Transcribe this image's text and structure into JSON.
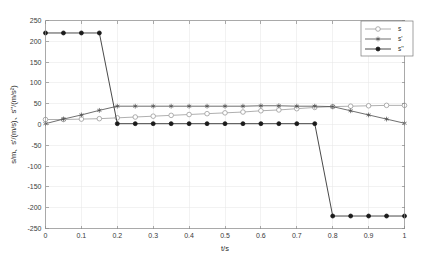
{
  "figure": {
    "background_color": "#ffffff",
    "axes_color": "#8a8a8a",
    "grid_color": "#e6e6e6"
  },
  "chart_data": {
    "type": "line",
    "title": "",
    "xlabel": "t/s",
    "ylabel": "s/m、s'/(m/s)、s''/(m/s²)",
    "xlim": [
      0,
      1
    ],
    "ylim": [
      -250,
      250
    ],
    "xticks": [
      0,
      0.1,
      0.2,
      0.3,
      0.4,
      0.5,
      0.6,
      0.7,
      0.8,
      0.9,
      1
    ],
    "xticklabels": [
      "0",
      "0.1",
      "0.2",
      "0.3",
      "0.4",
      "0.5",
      "0.6",
      "0.7",
      "0.8",
      "0.9",
      "1"
    ],
    "yticks": [
      -250,
      -200,
      -150,
      -100,
      -50,
      0,
      50,
      100,
      150,
      200,
      250
    ],
    "yticklabels": [
      "-250",
      "-200",
      "-150",
      "-100",
      "-50",
      "0",
      "50",
      "100",
      "150",
      "200",
      "250"
    ],
    "grid": true,
    "legend_position": "top-right",
    "x": [
      0,
      0.05,
      0.1,
      0.15,
      0.2,
      0.25,
      0.3,
      0.35,
      0.4,
      0.45,
      0.5,
      0.55,
      0.6,
      0.65,
      0.7,
      0.75,
      0.8,
      0.85,
      0.9,
      0.95,
      1
    ],
    "series": [
      {
        "name": "s",
        "marker": "circle-open",
        "color": "#9a9a9a",
        "values": [
          12,
          12,
          13,
          14,
          16,
          18,
          20,
          22,
          24,
          26,
          28,
          30,
          33,
          35,
          38,
          41,
          43,
          44,
          45,
          46,
          46
        ]
      },
      {
        "name": "s'",
        "marker": "asterisk",
        "color": "#4a4a4a",
        "values": [
          2,
          13,
          23,
          34,
          44,
          44,
          44,
          44,
          44,
          44,
          44,
          44,
          45,
          45,
          44,
          44,
          43,
          33,
          23,
          13,
          3
        ]
      },
      {
        "name": "s''",
        "marker": "circle-filled",
        "color": "#1a1a1a",
        "values": [
          220,
          220,
          220,
          220,
          2,
          2,
          2,
          2,
          2,
          2,
          2,
          2,
          2,
          2,
          2,
          2,
          -220,
          -220,
          -220,
          -220,
          -220
        ]
      }
    ]
  },
  "legend": {
    "items": [
      {
        "label": "s",
        "marker": "circle-open"
      },
      {
        "label": "s'",
        "marker": "asterisk"
      },
      {
        "label": "s''",
        "marker": "circle-filled"
      }
    ]
  }
}
